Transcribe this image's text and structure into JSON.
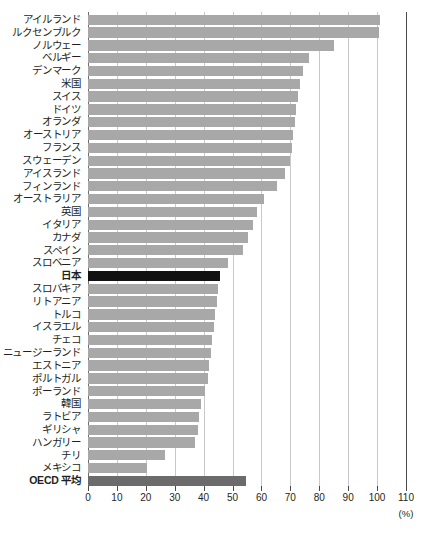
{
  "chart_data": {
    "type": "bar",
    "orientation": "horizontal",
    "title": "",
    "xlabel": "(%)",
    "ylabel": "",
    "xlim": [
      0,
      110
    ],
    "xticks": [
      0,
      10,
      20,
      30,
      40,
      50,
      60,
      70,
      80,
      90,
      100,
      110
    ],
    "xtick_labels": [
      "0",
      "10",
      "20",
      "30",
      "40",
      "50",
      "60",
      "70",
      "80",
      "90",
      "100",
      "110"
    ],
    "unit": "(%)",
    "grid": true,
    "grid_axis": "x",
    "legend": "none",
    "bar_color": "#a8a8a8",
    "highlight_color": "#111111",
    "average_color": "#6b6b6b",
    "categories": [
      "アイルランド",
      "ルクセンブルク",
      "ノルウェー",
      "ベルギー",
      "デンマーク",
      "米国",
      "スイス",
      "ドイツ",
      "オランダ",
      "オーストリア",
      "フランス",
      "スウェーデン",
      "アイスランド",
      "フィンランド",
      "オーストラリア",
      "英国",
      "イタリア",
      "カナダ",
      "スペイン",
      "スロベニア",
      "日本",
      "スロバキア",
      "リトアニア",
      "トルコ",
      "イスラエル",
      "チェコ",
      "ニュージーランド",
      "エストニア",
      "ポルトガル",
      "ポーランド",
      "韓国",
      "ラトビア",
      "ギリシャ",
      "ハンガリー",
      "チリ",
      "メキシコ",
      "OECD 平均"
    ],
    "values": [
      101.0,
      100.8,
      85.0,
      76.5,
      74.5,
      73.5,
      72.5,
      72.0,
      71.5,
      71.0,
      70.5,
      70.0,
      68.0,
      65.5,
      61.0,
      58.5,
      57.0,
      55.5,
      53.5,
      48.5,
      45.5,
      45.0,
      44.5,
      44.0,
      43.5,
      43.0,
      42.5,
      42.0,
      41.5,
      40.5,
      39.0,
      38.5,
      38.0,
      37.0,
      26.5,
      20.5,
      54.8
    ],
    "styles": [
      "normal",
      "normal",
      "normal",
      "normal",
      "normal",
      "normal",
      "normal",
      "normal",
      "normal",
      "normal",
      "normal",
      "normal",
      "normal",
      "normal",
      "normal",
      "normal",
      "normal",
      "normal",
      "normal",
      "normal",
      "highlight",
      "normal",
      "normal",
      "normal",
      "normal",
      "normal",
      "normal",
      "normal",
      "normal",
      "normal",
      "normal",
      "normal",
      "normal",
      "normal",
      "normal",
      "normal",
      "average"
    ]
  }
}
